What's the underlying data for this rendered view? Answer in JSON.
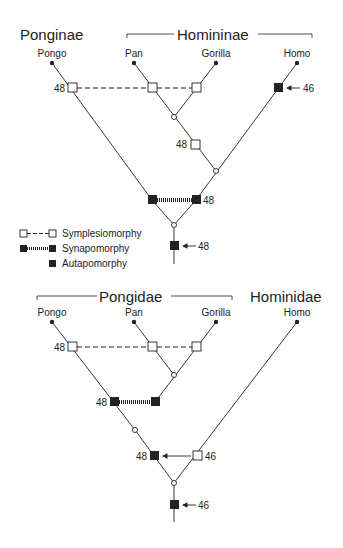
{
  "top_tree": {
    "group_left": "Ponginae",
    "group_right": "Homininae",
    "taxa": [
      "Pongo",
      "Pan",
      "Gorilla",
      "Homo"
    ],
    "labels": {
      "symplesio": "48",
      "homo_auto": "46",
      "inner": "48",
      "synapo": "48",
      "root_auto": "48"
    }
  },
  "legend": {
    "items": [
      "Symplesiomorphy",
      "Synapomorphy",
      "Autapomorphy"
    ]
  },
  "bottom_tree": {
    "group_left": "Pongidae",
    "group_right": "Hominidae",
    "taxa": [
      "Pongo",
      "Pan",
      "Gorilla",
      "Homo"
    ],
    "labels": {
      "symplesio": "48",
      "synapo": "48",
      "inner_black": "48",
      "inner_white": "46",
      "root_auto": "46"
    }
  },
  "colors": {
    "ink": "#222222",
    "background": "#ffffff"
  }
}
